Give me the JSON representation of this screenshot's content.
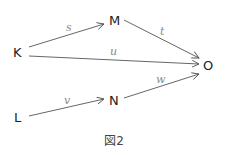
{
  "diagram": {
    "type": "directed-graph",
    "nodes": {
      "K": {
        "label": "K"
      },
      "M": {
        "label": "M"
      },
      "O": {
        "label": "O"
      },
      "N": {
        "label": "N"
      },
      "L": {
        "label": "L"
      }
    },
    "edges": {
      "s": {
        "from": "K",
        "to": "M",
        "label": "s"
      },
      "t": {
        "from": "M",
        "to": "O",
        "label": "t"
      },
      "u": {
        "from": "K",
        "to": "O",
        "label": "u"
      },
      "v": {
        "from": "L",
        "to": "N",
        "label": "v"
      },
      "w": {
        "from": "N",
        "to": "O",
        "label": "w"
      }
    },
    "caption": "図2"
  },
  "colors": {
    "node_text": "#222222",
    "edge_line": "#555555",
    "edge_label": "#8a8a8a",
    "background": "#ffffff"
  }
}
